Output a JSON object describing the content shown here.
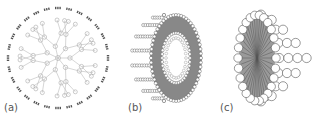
{
  "figure": {
    "panels": [
      {
        "id": "a",
        "label": "(a)",
        "depiction": "dendrimer-schematic"
      },
      {
        "id": "b",
        "label": "(b)",
        "depiction": "liposome-bilayer-cutaway"
      },
      {
        "id": "c",
        "label": "(c)",
        "depiction": "micelle-cutaway"
      }
    ],
    "colors": {
      "line": "#8a8a8a",
      "dark": "#555555",
      "fill": "#ffffff"
    }
  }
}
